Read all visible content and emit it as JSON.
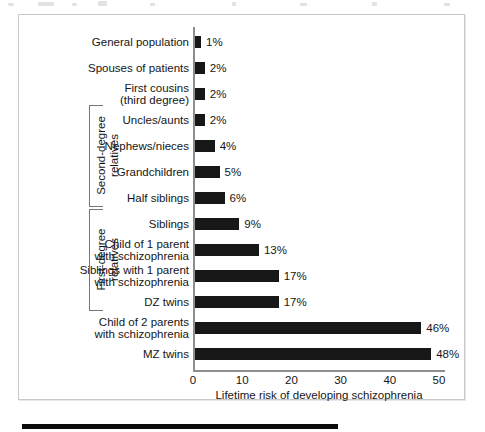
{
  "figure": {
    "caption_bar": "",
    "frame": {
      "border_color": "#c9c9c9",
      "background": "#ffffff"
    }
  },
  "chart_data": {
    "type": "bar",
    "orientation": "horizontal",
    "title": "",
    "xlabel": "Lifetime risk of developing schizophrenia",
    "ylabel": "",
    "xlim": [
      0,
      50
    ],
    "xticks": [
      0,
      10,
      20,
      30,
      40,
      50
    ],
    "xtick_labels": [
      "0",
      "10",
      "20",
      "30",
      "40",
      "50"
    ],
    "grid": false,
    "legend": null,
    "bar_color": "#171717",
    "axis_color": "#8e8e8e",
    "units": "%",
    "categories": [
      "General population",
      "Spouses of patients",
      "First cousins (third degree)",
      "Uncles/aunts",
      "Nephews/nieces",
      "Grandchildren",
      "Half siblings",
      "Siblings",
      "Child of 1 parent with schizophrenia",
      "Siblings with 1 parent with schizophrenia",
      "DZ twins",
      "Child of 2 parents with schizophrenia",
      "MZ twins"
    ],
    "values": [
      1,
      2,
      2,
      2,
      4,
      5,
      6,
      9,
      13,
      17,
      17,
      46,
      48
    ],
    "value_labels": [
      "1%",
      "2%",
      "2%",
      "2%",
      "4%",
      "5%",
      "6%",
      "9%",
      "13%",
      "17%",
      "17%",
      "46%",
      "48%"
    ],
    "bars": [
      {
        "label_lines": [
          "General population"
        ],
        "value": 1,
        "value_label": "1%"
      },
      {
        "label_lines": [
          "Spouses of patients"
        ],
        "value": 2,
        "value_label": "2%"
      },
      {
        "label_lines": [
          "First cousins",
          "(third degree)"
        ],
        "value": 2,
        "value_label": "2%"
      },
      {
        "label_lines": [
          "Uncles/aunts"
        ],
        "value": 2,
        "value_label": "2%"
      },
      {
        "label_lines": [
          "Nephews/nieces"
        ],
        "value": 4,
        "value_label": "4%"
      },
      {
        "label_lines": [
          "Grandchildren"
        ],
        "value": 5,
        "value_label": "5%"
      },
      {
        "label_lines": [
          "Half siblings"
        ],
        "value": 6,
        "value_label": "6%"
      },
      {
        "label_lines": [
          "Siblings"
        ],
        "value": 9,
        "value_label": "9%"
      },
      {
        "label_lines": [
          "Child of 1 parent",
          "with schizophrenia"
        ],
        "value": 13,
        "value_label": "13%"
      },
      {
        "label_lines": [
          "Siblings with 1 parent",
          "with schizophrenia"
        ],
        "value": 17,
        "value_label": "17%"
      },
      {
        "label_lines": [
          "DZ twins"
        ],
        "value": 17,
        "value_label": "17%"
      },
      {
        "label_lines": [
          "Child of 2 parents",
          "with schizophrenia"
        ],
        "value": 46,
        "value_label": "46%"
      },
      {
        "label_lines": [
          "MZ twins"
        ],
        "value": 48,
        "value_label": "48%"
      }
    ],
    "groups": [
      {
        "name": "second-degree-relatives",
        "label_lines": [
          "Second-degree",
          "relatives"
        ],
        "first_index": 3,
        "last_index": 6
      },
      {
        "name": "first-degree-relatives",
        "label_lines": [
          "First-degree",
          "relatives"
        ],
        "first_index": 7,
        "last_index": 10
      }
    ]
  }
}
